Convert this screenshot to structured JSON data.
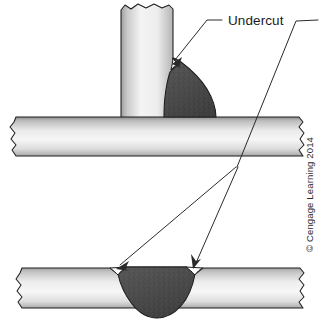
{
  "figure": {
    "background_color": "#ffffff",
    "labels": {
      "undercut": "Undercut"
    },
    "credit": "© Cengage Learning 2014",
    "colors": {
      "outline": "#1c1c1c",
      "weld_bead_dark": "#4a4a4a",
      "weld_bead_light": "#5a5a5a",
      "plate_light": "#f2f2f2",
      "plate_mid": "#d9d9d9",
      "plate_dark": "#9a9a9a",
      "leader_line": "#2a2a2a",
      "text": "#1a1a1a"
    },
    "parts": [
      {
        "id": "vertical-plate",
        "name": "Vertical plate (T-joint member)",
        "description": "Upright steel plate with jagged break line at top"
      },
      {
        "id": "horizontal-plate-top",
        "name": "Horizontal base plate (T-joint)",
        "description": "Base plate with jagged break lines at both ends"
      },
      {
        "id": "fillet-weld-bead",
        "name": "Fillet weld bead",
        "description": "Dark textured weld deposit in the T-joint corner"
      },
      {
        "id": "undercut-notch-fillet",
        "name": "Undercut notch at fillet weld toe",
        "description": "Groove melted into the vertical plate at the weld toe"
      },
      {
        "id": "butt-plate",
        "name": "Butt joint plate",
        "description": "Lower flat plate with jagged break lines at both ends"
      },
      {
        "id": "groove-weld-bead",
        "name": "Groove weld bead",
        "description": "Dark textured weld deposit filling the butt joint"
      },
      {
        "id": "undercut-notch-left",
        "name": "Left undercut notch at groove weld toe",
        "description": "Groove melted into the base metal on the left weld toe"
      },
      {
        "id": "undercut-notch-right",
        "name": "Right undercut notch at groove weld toe",
        "description": "Groove melted into the base metal on the right weld toe"
      }
    ],
    "leaders": [
      {
        "id": "leader-fillet",
        "name": "Leader line to fillet weld undercut",
        "from": "Undercut label",
        "to": "undercut-notch-fillet"
      },
      {
        "id": "leader-butt-left",
        "name": "Leader line to left groove weld undercut",
        "from": "Undercut label",
        "to": "undercut-notch-left"
      },
      {
        "id": "leader-butt-right",
        "name": "Leader line to right groove weld undercut",
        "from": "Undercut label",
        "to": "undercut-notch-right"
      }
    ]
  }
}
